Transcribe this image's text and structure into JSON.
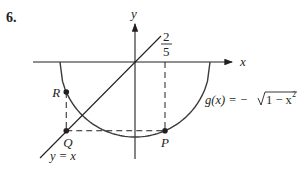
{
  "problem_number": "6.",
  "axes": {
    "x_label": "x",
    "y_label": "y"
  },
  "tick_label": {
    "numerator": "2",
    "denominator": "5",
    "value": 0.4
  },
  "curve": {
    "label_prefix": "g(x) = −",
    "label_radicand": "1 − x",
    "label_exponent": "2",
    "function": "g(x) = -sqrt(1 - x^2)",
    "domain": [
      -1,
      1
    ]
  },
  "line": {
    "label": "y = x"
  },
  "points": [
    {
      "name": "P",
      "x": 0.4,
      "y": -0.9165
    },
    {
      "name": "Q",
      "x": -0.9165,
      "y": -0.9165
    },
    {
      "name": "R",
      "x": -0.9165,
      "y": -0.4
    }
  ],
  "colors": {
    "ink": "#231f20",
    "curve": "#3a3a3a"
  }
}
